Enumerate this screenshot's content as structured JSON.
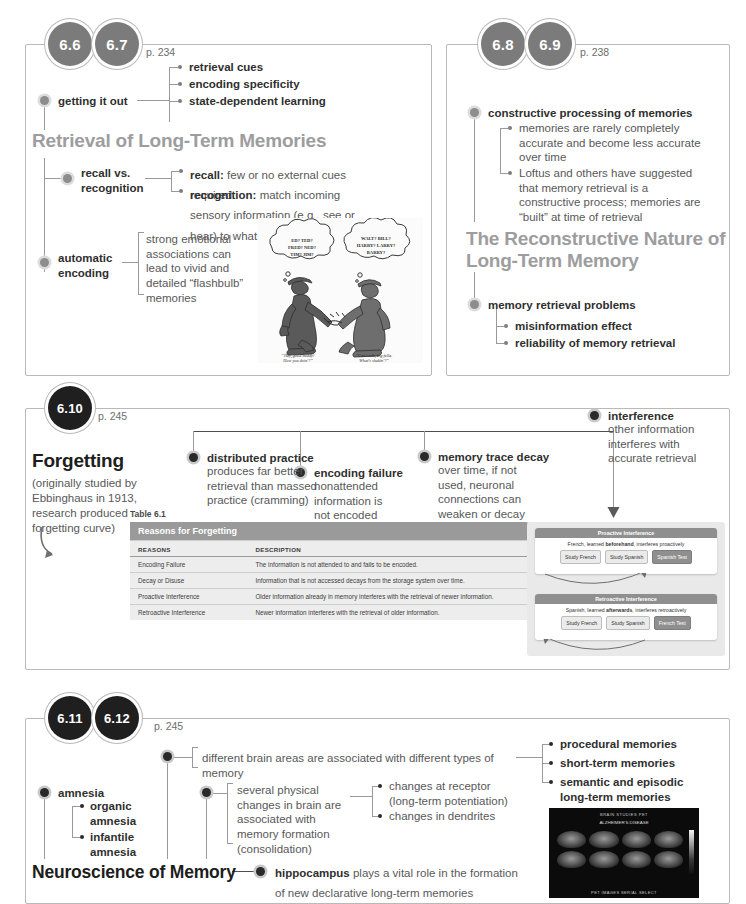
{
  "panels": {
    "p1": {
      "badges": [
        "6.6",
        "6.7"
      ],
      "page": "p. 234",
      "heading": "Retrieval of Long-Term Memories",
      "node_getting_out": "getting it out",
      "leaves": [
        "retrieval cues",
        "encoding specificity",
        "state-dependent learning"
      ],
      "node_recall": "recall vs.\nrecognition",
      "recall_term": "recall:",
      "recall_text": " few or no external cues required",
      "recognition_term": "recognition:",
      "recognition_text": " match incoming sensory information (e.g., see or hear) to what is already in memory",
      "node_auto": "automatic\nencoding",
      "auto_text": "strong emotional associations can lead to vivid and detailed “flashbulb” memories",
      "cartoon": {
        "bubble_left": "ED? TED? FRED? NED? TIM? JIM?",
        "bubble_right": "WALT? BILL? HARRY? LARRY? BARRY?",
        "caption_left": "“Hey, good buddy! How you doin'?”",
        "caption_right": "“Can't talk, big fella. What's shakin'?”"
      }
    },
    "p2": {
      "badges": [
        "6.8",
        "6.9"
      ],
      "page": "p. 238",
      "node_constructive": "constructive processing of memories",
      "leaf1": "memories are rarely completely accurate and become less accurate over time",
      "leaf2": "Loftus and others have suggested that memory retrieval is a constructive process; memories are “built” at time of retrieval",
      "heading": "The Reconstructive Nature of Long-Term Memory",
      "node_problems": "memory retrieval problems",
      "leaves": [
        "misinformation effect",
        "reliability of memory retrieval"
      ]
    },
    "p3": {
      "badges": [
        "6.10"
      ],
      "page": "p. 245",
      "heading": "Forgetting",
      "subtext": "(originally studied by Ebbinghaus in 1913, research produced forgetting curve)",
      "node_distributed": "distributed practice",
      "distributed_text": "produces far better retrieval than massed practice (cramming)",
      "node_encoding": "encoding failure",
      "encoding_text": "nonattended information is not encoded into memory",
      "node_decay": "memory trace decay",
      "decay_text": "over time, if not used, neuronal connections can weaken or decay",
      "node_interference": "interference",
      "interference_text": "other information interferes with accurate retrieval",
      "table": {
        "caption": "Table 6.1",
        "title": "Reasons for Forgetting",
        "columns": [
          "REASONS",
          "DESCRIPTION"
        ],
        "rows": [
          [
            "Encoding Failure",
            "The information is not attended to and fails to be encoded."
          ],
          [
            "Decay or Disuse",
            "Information that is not accessed decays from the storage system over time."
          ],
          [
            "Proactive Interference",
            "Older information already in memory interferes with the retrieval of newer information."
          ],
          [
            "Retroactive Interference",
            "Newer information interferes with the retrieval of older information."
          ]
        ]
      },
      "figure": {
        "proactive": {
          "title": "Proactive Interference",
          "caption_a": "French, learned ",
          "caption_b": "beforehand",
          "caption_c": ", interferes proactively",
          "steps": [
            "Study French",
            "Study Spanish"
          ],
          "test": "Spanish Test"
        },
        "retroactive": {
          "title": "Retroactive Interference",
          "caption_a": "Spanish, learned ",
          "caption_b": "afterwards",
          "caption_c": ", interferes retroactively",
          "steps": [
            "Study French",
            "Study Spanish"
          ],
          "test": "French Test"
        }
      }
    },
    "p4": {
      "badges": [
        "6.11",
        "6.12"
      ],
      "page": "p. 245",
      "heading": "Neuroscience of Memory",
      "node_amnesia": "amnesia",
      "amnesia_leaves": [
        "organic\namnesia",
        "infantile\namnesia"
      ],
      "brain_areas": "different brain areas are associated with different types of memory",
      "memory_types": [
        "procedural memories",
        "short-term memories",
        "semantic and episodic\nlong-term memories"
      ],
      "physical_changes": "several physical changes in brain are associated with memory formation (consolidation)",
      "change_leaves": [
        "changes at receptor\n(long-term potentiation)",
        "changes in dendrites"
      ],
      "hippo_term": "hippocampus",
      "hippo_text": " plays a vital role in the formation of new declarative long-term memories",
      "scan": {
        "top_label": "BRAIN STUDIES  PET",
        "sub_label": "ALZHEIMER'S DISEASE",
        "bottom_label": "PET IMAGES SERIAL SELECT"
      }
    }
  },
  "colors": {
    "badge_gray": "#7b7b7b",
    "badge_dark": "#1f1f1f",
    "heading_gray": "#9d9d9f",
    "text": "#58585a",
    "rule": "#9a9a9a"
  }
}
